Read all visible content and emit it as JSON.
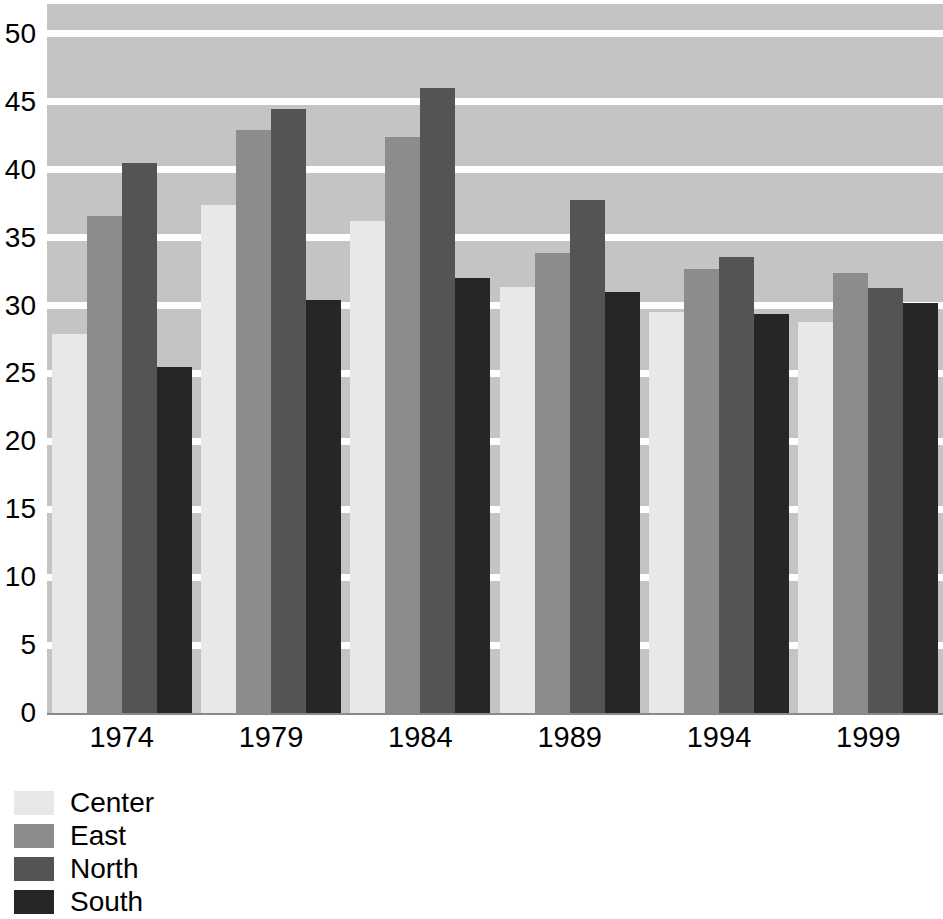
{
  "chart_data": {
    "type": "bar",
    "title": "",
    "subtitle": "",
    "xlabel": "",
    "ylabel": "",
    "categories": [
      "1974",
      "1979",
      "1984",
      "1989",
      "1994",
      "1999"
    ],
    "series": [
      {
        "name": "Center",
        "color": "#e8e8e8",
        "values": [
          27.9,
          37.4,
          36.2,
          31.4,
          29.5,
          28.8
        ]
      },
      {
        "name": "East",
        "color": "#8c8c8c",
        "values": [
          36.6,
          42.9,
          42.4,
          33.9,
          32.7,
          32.4
        ]
      },
      {
        "name": "North",
        "color": "#545454",
        "values": [
          40.5,
          44.5,
          46.0,
          37.8,
          33.6,
          31.3
        ]
      },
      {
        "name": "South",
        "color": "#262626",
        "values": [
          25.5,
          30.4,
          32.0,
          31.0,
          29.4,
          30.2
        ]
      }
    ],
    "ylim": [
      0,
      52.5
    ],
    "yticks": [
      0,
      5,
      10,
      15,
      20,
      25,
      30,
      35,
      40,
      45,
      50
    ],
    "ytick_labels": [
      "0",
      "5",
      "10",
      "15",
      "20",
      "25",
      "30",
      "35",
      "40",
      "45",
      "50"
    ],
    "grid": true,
    "grid_color": "#ffffff",
    "plot_background": "#c4c4c4",
    "legend_position": "below-left",
    "legend_entries": [
      "Center",
      "East",
      "North",
      "South"
    ]
  }
}
